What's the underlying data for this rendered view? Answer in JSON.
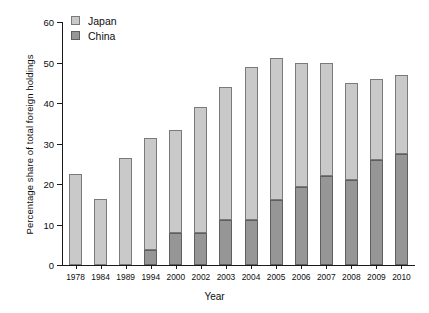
{
  "chart_data": {
    "type": "bar",
    "stacked": true,
    "title": "",
    "xlabel": "Year",
    "ylabel": "Percentage share of total foreign holdings",
    "ylim": [
      0,
      60
    ],
    "yticks": [
      0,
      10,
      20,
      30,
      40,
      50,
      60
    ],
    "ytick_labels": [
      "0",
      "10",
      "20",
      "30",
      "40",
      "50",
      "60"
    ],
    "grid": false,
    "legend_position": "top-left",
    "categories": [
      "1978",
      "1984",
      "1989",
      "1994",
      "2000",
      "2002",
      "2003",
      "2004",
      "2005",
      "2006",
      "2007",
      "2008",
      "2009",
      "2010"
    ],
    "series": [
      {
        "name": "China",
        "color": "#969696",
        "values": [
          0,
          0,
          0,
          3.7,
          8,
          8,
          11,
          11,
          16,
          19.2,
          22,
          21,
          26,
          27.5
        ]
      },
      {
        "name": "Japan",
        "color": "#c9c9c9",
        "values": [
          22.5,
          16.3,
          26.5,
          27.7,
          25.3,
          31,
          33,
          38,
          35,
          30.8,
          28,
          24,
          20,
          19.5
        ]
      }
    ],
    "totals": [
      22.5,
      16.3,
      26.5,
      31.4,
      33.3,
      39,
      44,
      49,
      51,
      50,
      50,
      45,
      46,
      47
    ]
  },
  "legend": {
    "items": [
      {
        "label": "Japan",
        "key": "japan"
      },
      {
        "label": "China",
        "key": "china"
      }
    ]
  },
  "axes": {
    "x_title": "Year",
    "y_title": "Percentage share of total foreign holdings"
  }
}
